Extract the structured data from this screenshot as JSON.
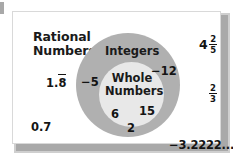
{
  "diagram": {
    "type": "nested-set-venn",
    "sets": [
      {
        "id": "rational",
        "label_line1": "Rational",
        "label_line2": "Numbers",
        "region": "outer",
        "fill_color": "#ffffff"
      },
      {
        "id": "integers",
        "label": "Integers",
        "region": "middle",
        "fill_color": "#b0b0b0"
      },
      {
        "id": "whole",
        "label_line1": "Whole",
        "label_line2": "Numbers",
        "region": "inner",
        "fill_color": "#e8e8e8"
      }
    ],
    "members": {
      "rational_only": [
        {
          "id": "one-point-eight-repeating",
          "prefix": "1.",
          "repeating": "8"
        },
        {
          "id": "zero-point-seven",
          "text": "0.7"
        },
        {
          "id": "four-and-two-fifths",
          "whole": "4",
          "numerator": "2",
          "denominator": "5"
        },
        {
          "id": "two-thirds",
          "whole": "",
          "numerator": "2",
          "denominator": "3"
        },
        {
          "id": "negative-three-point-two-repeating",
          "text": "−3.2222..."
        }
      ],
      "integers_only": [
        {
          "id": "negative-five",
          "text": "−5"
        },
        {
          "id": "negative-twelve",
          "text": "−12"
        }
      ],
      "whole_numbers": [
        {
          "id": "six",
          "text": "6"
        },
        {
          "id": "fifteen",
          "text": "15"
        },
        {
          "id": "two",
          "text": "2"
        }
      ]
    }
  }
}
